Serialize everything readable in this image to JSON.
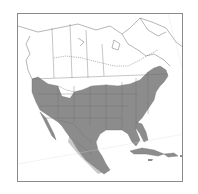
{
  "map": {
    "region": "North America",
    "type": "species range map",
    "colors": {
      "background": "#ffffff",
      "frame": "#8a8a8a",
      "borders": "#6e6e6e",
      "range_fill": "#8c8c8c",
      "light_fill": "#c8c8c8",
      "dotted_line": "#6e6e6e"
    },
    "legend": {
      "dark_shade": "range",
      "light_shade": "partial range",
      "dotted_line": "range limit"
    }
  }
}
